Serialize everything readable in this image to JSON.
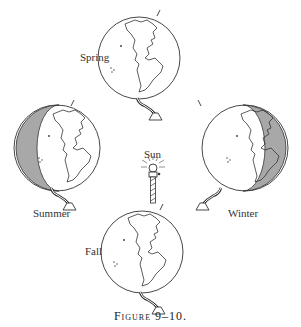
{
  "figure": {
    "caption": "Figure 9–10.",
    "center_label": "Sun",
    "globes": [
      {
        "season": "Spring",
        "position": "top",
        "shading": "none"
      },
      {
        "season": "Summer",
        "position": "left",
        "shading": "left-half-dark"
      },
      {
        "season": "Winter",
        "position": "right",
        "shading": "right-half-dark"
      },
      {
        "season": "Fall",
        "position": "bottom",
        "shading": "none"
      }
    ],
    "colors": {
      "line": "#333333",
      "shade": "#a8a8a8",
      "background": "#ffffff"
    }
  }
}
